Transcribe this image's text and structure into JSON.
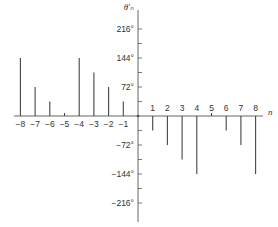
{
  "chart_data": {
    "type": "stem",
    "title": "",
    "xlabel": "n",
    "ylabel": "θ'ₙ",
    "x": [
      -8,
      -7,
      -6,
      -5,
      -4,
      -3,
      -2,
      -1,
      1,
      2,
      3,
      4,
      5,
      6,
      7,
      8
    ],
    "values": [
      144,
      72,
      36,
      0,
      144,
      108,
      72,
      36,
      -36,
      -72,
      -108,
      -144,
      0,
      -36,
      -72,
      -144
    ],
    "units": "degrees",
    "xticks": [
      "-8",
      "-7",
      "-6",
      "-5",
      "-4",
      "-3",
      "-2",
      "-1",
      "1",
      "2",
      "3",
      "4",
      "5",
      "6",
      "7",
      "8"
    ],
    "yticks_labeled": [
      "216°",
      "144°",
      "72°",
      "-72°",
      "-144°",
      "-216°"
    ],
    "yticks_values": [
      216,
      144,
      72,
      -72,
      -144,
      -216
    ],
    "minor_ytick_step": 36,
    "ylim": [
      -230,
      240
    ],
    "xlim": [
      -8.5,
      8.6
    ],
    "grid": false,
    "legend": null,
    "colors": {
      "stem": "#444444",
      "axis": "#555555",
      "text": "#333333"
    }
  }
}
